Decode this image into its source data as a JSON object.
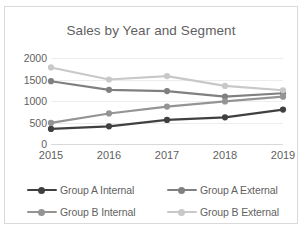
{
  "chart_data": {
    "type": "line",
    "title": "Sales by Year and Segment",
    "xlabel": "",
    "ylabel": "",
    "categories": [
      "2015",
      "2016",
      "2017",
      "2018",
      "2019"
    ],
    "ylim": [
      0,
      2000
    ],
    "yticks": [
      0,
      500,
      1000,
      1500,
      2000
    ],
    "ytick_labels": [
      "0",
      "500",
      "1000",
      "1500",
      "2000"
    ],
    "grid": true,
    "legend_position": "bottom",
    "series": [
      {
        "name": "Group A Internal",
        "color": "#404040",
        "values": [
          350,
          410,
          560,
          620,
          800
        ]
      },
      {
        "name": "Group A External",
        "color": "#808080",
        "values": [
          1460,
          1260,
          1230,
          1100,
          1180
        ]
      },
      {
        "name": "Group B Internal",
        "color": "#949494",
        "values": [
          490,
          710,
          870,
          990,
          1100
        ]
      },
      {
        "name": "Group B External",
        "color": "#c8c8c8",
        "values": [
          1780,
          1500,
          1580,
          1350,
          1250
        ]
      }
    ]
  },
  "style": {
    "text_color": "#5f5f5f",
    "grid_color": "#ededed",
    "border_color": "#d9d9d9",
    "background": "#ffffff"
  }
}
